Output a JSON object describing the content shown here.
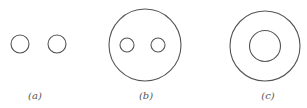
{
  "figure": {
    "panels": [
      {
        "id": "a",
        "label": "(a)",
        "description": "two separate small circles"
      },
      {
        "id": "b",
        "label": "(b)",
        "description": "large circle enclosing two small circles"
      },
      {
        "id": "c",
        "label": "(c)",
        "description": "two concentric circles (annulus)"
      }
    ],
    "line_color": "#555555",
    "background": "#ffffff"
  }
}
